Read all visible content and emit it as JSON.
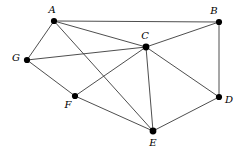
{
  "figure": {
    "type": "undirected-graph-diagram",
    "width": 245,
    "height": 153,
    "background_color": "#ffffff",
    "edge_color": "#3a3a3a",
    "vertex_color": "#000000",
    "label_style": "italic-serif"
  },
  "graph": {
    "vertices": [
      {
        "id": "A",
        "label": "A",
        "x": 54,
        "y": 21,
        "r": 3.1,
        "label_x": 52,
        "label_y": 10
      },
      {
        "id": "B",
        "label": "B",
        "x": 219,
        "y": 22,
        "r": 3.1,
        "label_x": 214,
        "label_y": 11
      },
      {
        "id": "C",
        "label": "C",
        "x": 146,
        "y": 47,
        "r": 3.4,
        "label_x": 145,
        "label_y": 36
      },
      {
        "id": "G",
        "label": "G",
        "x": 27,
        "y": 60,
        "r": 3.1,
        "label_x": 16,
        "label_y": 58
      },
      {
        "id": "F",
        "label": "F",
        "x": 75,
        "y": 96,
        "r": 3.1,
        "label_x": 68,
        "label_y": 105
      },
      {
        "id": "D",
        "label": "D",
        "x": 219,
        "y": 97,
        "r": 3.1,
        "label_x": 229,
        "label_y": 100
      },
      {
        "id": "E",
        "label": "E",
        "x": 153,
        "y": 131,
        "r": 3.4,
        "label_x": 153,
        "label_y": 143
      }
    ],
    "edges": [
      {
        "from": "A",
        "to": "B"
      },
      {
        "from": "A",
        "to": "C"
      },
      {
        "from": "A",
        "to": "G"
      },
      {
        "from": "A",
        "to": "E"
      },
      {
        "from": "B",
        "to": "C"
      },
      {
        "from": "B",
        "to": "D"
      },
      {
        "from": "C",
        "to": "G"
      },
      {
        "from": "C",
        "to": "F"
      },
      {
        "from": "C",
        "to": "E"
      },
      {
        "from": "C",
        "to": "D"
      },
      {
        "from": "G",
        "to": "F"
      },
      {
        "from": "F",
        "to": "E"
      },
      {
        "from": "E",
        "to": "D"
      }
    ]
  }
}
